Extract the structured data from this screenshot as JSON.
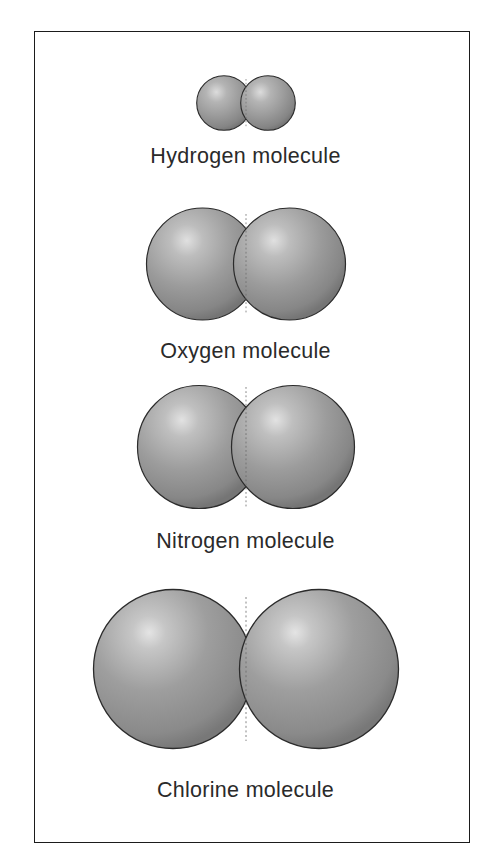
{
  "figure": {
    "background_color": "#ffffff",
    "frame_color": "#1b1b1b",
    "sphere_base_color": "#9a9a9a",
    "sphere_highlight_color": "#dcdcdc",
    "sphere_shadow_color": "#6f6f6f",
    "sphere_outline_color": "#2b2b2b",
    "label_color": "#2a2a2a"
  },
  "molecules": [
    {
      "id": "hydrogen",
      "label": "Hydrogen molecule",
      "atom_count": 2,
      "sphere_diameter_px": 56,
      "center_separation_px": 44,
      "overlap_px": 12
    },
    {
      "id": "oxygen",
      "label": "Oxygen molecule",
      "atom_count": 2,
      "sphere_diameter_px": 113,
      "center_separation_px": 87,
      "overlap_px": 26
    },
    {
      "id": "nitrogen",
      "label": "Nitrogen molecule",
      "atom_count": 2,
      "sphere_diameter_px": 124,
      "center_separation_px": 94,
      "overlap_px": 30
    },
    {
      "id": "chlorine",
      "label": "Chlorine molecule",
      "atom_count": 2,
      "sphere_diameter_px": 160,
      "center_separation_px": 146,
      "overlap_px": 14
    }
  ]
}
